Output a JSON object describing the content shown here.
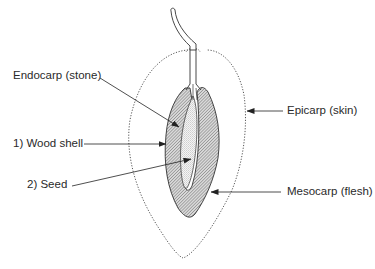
{
  "colors": {
    "line": "#333333",
    "hatch": "#555555",
    "seed_dots": "#9a9a9a",
    "background": "#ffffff"
  },
  "labels": {
    "endocarp": "Endocarp (stone)",
    "epicarp": "Epicarp (skin)",
    "wood_shell": "1) Wood shell",
    "seed": "2) Seed",
    "mesocarp": "Mesocarp (flesh)"
  },
  "parts": [
    {
      "id": "stem",
      "name": "Stem"
    },
    {
      "id": "epicarp",
      "name": "Epicarp (skin)",
      "style": "dotted outline"
    },
    {
      "id": "mesocarp",
      "name": "Mesocarp (flesh)",
      "style": "white fill"
    },
    {
      "id": "endocarp",
      "name": "Endocarp (stone)",
      "style": "hatched"
    },
    {
      "id": "seed",
      "name": "Seed",
      "style": "stippled"
    }
  ]
}
